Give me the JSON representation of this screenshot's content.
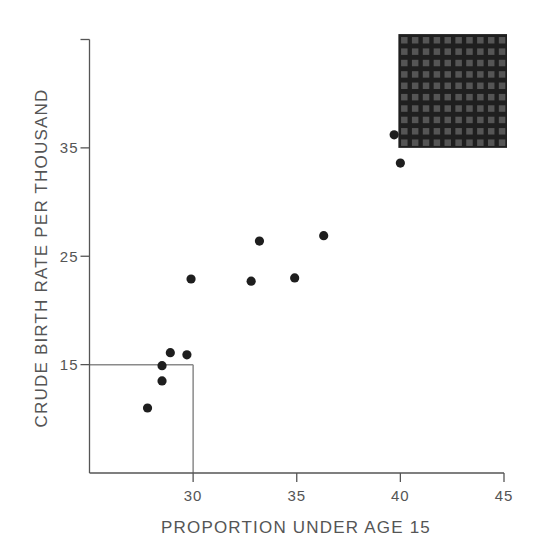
{
  "chart_data": {
    "type": "scatter",
    "title": "",
    "xlabel": "PROPORTION UNDER AGE 15",
    "ylabel": "CRUDE BIRTH RATE PER THOUSAND",
    "xlim": [
      25,
      45
    ],
    "ylim": [
      5,
      45
    ],
    "x_ticks": [
      30,
      35,
      40,
      45
    ],
    "x_tick_labels": [
      "30",
      "35",
      "40",
      "45"
    ],
    "y_ticks": [
      15,
      25,
      35
    ],
    "y_tick_labels": [
      "15",
      "25",
      "35"
    ],
    "grid": false,
    "legend": null,
    "series": [
      {
        "name": "countries",
        "points": [
          {
            "x": 27.8,
            "y": 11.0
          },
          {
            "x": 28.5,
            "y": 14.9
          },
          {
            "x": 28.5,
            "y": 13.5
          },
          {
            "x": 28.9,
            "y": 16.1
          },
          {
            "x": 29.7,
            "y": 15.9
          },
          {
            "x": 29.9,
            "y": 22.9
          },
          {
            "x": 32.8,
            "y": 22.7
          },
          {
            "x": 33.2,
            "y": 26.4
          },
          {
            "x": 34.9,
            "y": 23.0
          },
          {
            "x": 36.3,
            "y": 26.9
          },
          {
            "x": 39.7,
            "y": 36.2
          },
          {
            "x": 40.0,
            "y": 33.6
          }
        ]
      }
    ],
    "annotations": [
      {
        "type": "reference-lines",
        "description": "Gray lines marking x=30 and y=15 forming a lower-left box",
        "x": 30,
        "y": 15
      },
      {
        "type": "shaded-region",
        "description": "Dark hatched square in upper-right corner",
        "x_range": [
          40,
          45
        ],
        "y_range": [
          35,
          45.5
        ]
      }
    ]
  },
  "colors": {
    "axis": "#555555",
    "point": "#1e1e1e",
    "reference_line": "#8a8a8a",
    "region_fill": "#1f1f1f",
    "region_cell": "#555555"
  }
}
